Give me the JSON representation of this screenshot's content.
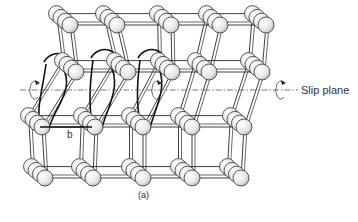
{
  "figure": {
    "caption": "(a)",
    "slip_plane_label": "Slip plane",
    "burgers_vector_label": "b",
    "colors": {
      "line": "#2a2a2a",
      "atom_fill": "#eeeeee",
      "atom_shade": "#b8b8b8",
      "slip_line": "#555555",
      "background": "#ffffff"
    },
    "slip_plane_y": 90,
    "atom_radius": 8,
    "depth_step": [
      -4.5,
      -3.8
    ],
    "depth_count": 4,
    "layers": [
      {
        "name": "top",
        "y": 25,
        "xs": [
          70,
          117,
          171,
          220,
          266
        ]
      },
      {
        "name": "upper-sheared",
        "y": 72,
        "xs": [
          76,
          128,
          172,
          209,
          262
        ]
      },
      {
        "name": "lower",
        "y": 127,
        "xs": [
          42,
          95,
          143,
          192,
          244
        ]
      },
      {
        "name": "bottom",
        "y": 178,
        "xs": [
          45,
          93,
          143,
          192,
          241
        ]
      }
    ],
    "rotation_arrows": [
      {
        "x": 33,
        "y": 90
      },
      {
        "x": 155,
        "y": 90
      },
      {
        "x": 279,
        "y": 90
      }
    ],
    "dislocation_loops": [
      {
        "from": [
          56,
          64
        ],
        "to": [
          42,
          127
        ]
      },
      {
        "from": [
          103,
          60
        ],
        "to": [
          95,
          127
        ]
      },
      {
        "from": [
          150,
          60
        ],
        "to": [
          143,
          127
        ]
      }
    ]
  }
}
